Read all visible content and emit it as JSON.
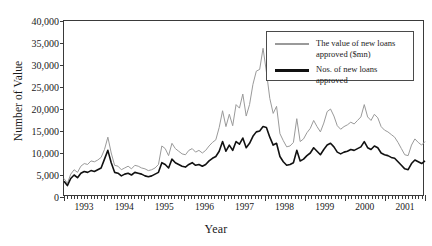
{
  "page": {
    "cut_off_title": ""
  },
  "chart_data": {
    "type": "line",
    "title": "",
    "xlabel": "Year",
    "ylabel": "Number of Value",
    "ylim": [
      0,
      40000
    ],
    "ytick_labels": [
      "0",
      "5,000",
      "10,000",
      "15,000",
      "20,000",
      "25,000",
      "30,000",
      "35,000",
      "40,000"
    ],
    "ytick_values": [
      0,
      5000,
      10000,
      15000,
      20000,
      25000,
      30000,
      35000,
      40000
    ],
    "xtick_labels": [
      "1993",
      "1994",
      "1995",
      "1996",
      "1997",
      "1998",
      "1999",
      "2000",
      "2001"
    ],
    "x_start_year": 1993,
    "x_end_year": 2001,
    "x_ticks_per_year": 12,
    "grid": false,
    "legend_position": "top-right",
    "colors": {
      "value_line": "#9a9a9a",
      "number_line": "#111111",
      "axis": "#3a3a3a"
    },
    "series": [
      {
        "name": "The value of new loans approved ($mn)",
        "color": "#9a9a9a",
        "values": [
          4200,
          3100,
          5200,
          6200,
          5600,
          7000,
          7600,
          7400,
          8200,
          8000,
          8400,
          9000,
          10800,
          13600,
          10000,
          7200,
          7000,
          6200,
          6600,
          7000,
          6400,
          7200,
          7000,
          6600,
          6400,
          6000,
          6200,
          6600,
          7400,
          11600,
          11000,
          9400,
          12200,
          11000,
          10400,
          9800,
          9600,
          10600,
          11000,
          10200,
          10600,
          10000,
          10600,
          11600,
          12400,
          13000,
          15800,
          19600,
          16000,
          18800,
          16200,
          21000,
          20200,
          23400,
          18400,
          21000,
          25600,
          28600,
          29000,
          33800,
          28400,
          22400,
          19000,
          20600,
          14400,
          12800,
          11400,
          11600,
          12400,
          17800,
          12600,
          13200,
          14600,
          15600,
          17400,
          16000,
          14800,
          16800,
          19400,
          20000,
          18400,
          16200,
          15400,
          16000,
          16400,
          17000,
          16600,
          17400,
          18200,
          21000,
          18200,
          17400,
          18800,
          18000,
          16000,
          15200,
          14800,
          14200,
          13600,
          12400,
          11000,
          9600,
          9400,
          11800,
          13200,
          12400,
          11800,
          12600
        ]
      },
      {
        "name": "Nos. of new loans approved",
        "color": "#111111",
        "values": [
          3600,
          2600,
          4200,
          5000,
          4400,
          5400,
          5800,
          5600,
          6000,
          5800,
          6200,
          6600,
          8600,
          10600,
          7800,
          5600,
          5400,
          4800,
          5200,
          5400,
          5000,
          5600,
          5400,
          5200,
          4800,
          4600,
          4800,
          5200,
          5600,
          7800,
          7400,
          6600,
          8600,
          7800,
          7400,
          7000,
          6800,
          7400,
          7800,
          7200,
          7400,
          7000,
          7400,
          8200,
          8800,
          9200,
          10400,
          12600,
          10400,
          11800,
          10600,
          12600,
          12000,
          13400,
          11200,
          12200,
          13800,
          14800,
          15000,
          16000,
          15800,
          13600,
          11800,
          12200,
          9200,
          8000,
          7200,
          7400,
          7800,
          10600,
          8200,
          8600,
          9400,
          10000,
          11200,
          10400,
          9600,
          10800,
          11800,
          12200,
          11400,
          10200,
          9800,
          10200,
          10400,
          10800,
          10600,
          11000,
          11400,
          12600,
          11200,
          10800,
          11600,
          11200,
          10000,
          9600,
          9400,
          9000,
          8800,
          8000,
          7200,
          6400,
          6200,
          7600,
          8400,
          8000,
          7600,
          8200
        ]
      }
    ]
  },
  "legend": {
    "items": [
      {
        "label_line1": "The value of new loans",
        "label_line2": "approved ($mn)",
        "swatch": "gray"
      },
      {
        "label_line1": "Nos. of new loans approved",
        "label_line2": "",
        "swatch": "black"
      }
    ]
  }
}
